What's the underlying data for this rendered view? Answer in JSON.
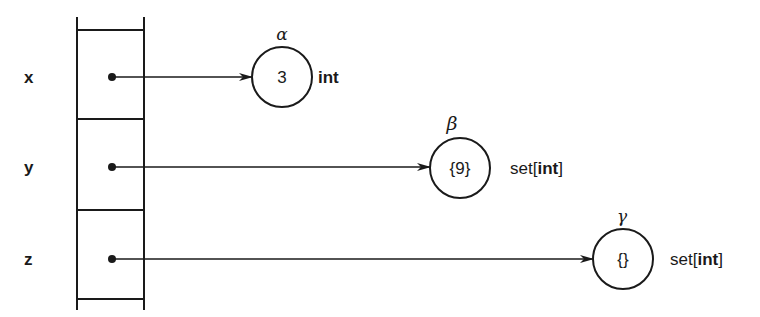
{
  "diagram": {
    "type": "variable-object-reference-diagram",
    "variables": [
      {
        "name": "x",
        "points_to": "alpha"
      },
      {
        "name": "y",
        "points_to": "beta"
      },
      {
        "name": "z",
        "points_to": "gamma"
      }
    ],
    "objects": [
      {
        "id": "alpha",
        "greek": "α",
        "value": "3",
        "type_label": "int",
        "type_prefix": "",
        "type_bold": "int",
        "type_suffix": ""
      },
      {
        "id": "beta",
        "greek": "β",
        "value": "{9}",
        "type_label": "set[int]",
        "type_prefix": "set[",
        "type_bold": "int",
        "type_suffix": "]"
      },
      {
        "id": "gamma",
        "greek": "γ",
        "value": "{}",
        "type_label": "set[int]",
        "type_prefix": "set[",
        "type_bold": "int",
        "type_suffix": "]"
      }
    ],
    "colors": {
      "ink": "#1a1a1a",
      "background": "#ffffff"
    }
  }
}
